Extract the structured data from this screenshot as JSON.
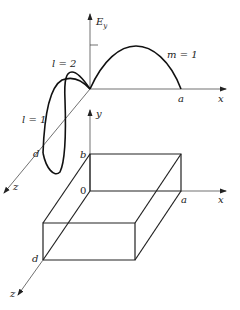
{
  "figure": {
    "type": "waveguide-cavity-mode-diagram",
    "upper_plot": {
      "y_axis_label_main": "E",
      "y_axis_label_sub": "y",
      "x_axis_label": "x",
      "z_axis_label": "z",
      "x_end_label": "a",
      "z_end_label": "d",
      "curves": [
        {
          "label": "m = 1",
          "direction": "x",
          "halfwaves": 1
        },
        {
          "label": "l = 1",
          "direction": "z",
          "halfwaves": 1
        },
        {
          "label": "l = 2",
          "direction": "z",
          "halfwaves": 2
        }
      ]
    },
    "lower_box": {
      "x_axis_label": "x",
      "y_axis_label": "y",
      "z_axis_label": "z",
      "origin_label": "0",
      "a_label": "a",
      "b_label": "b",
      "d_label": "d"
    }
  }
}
